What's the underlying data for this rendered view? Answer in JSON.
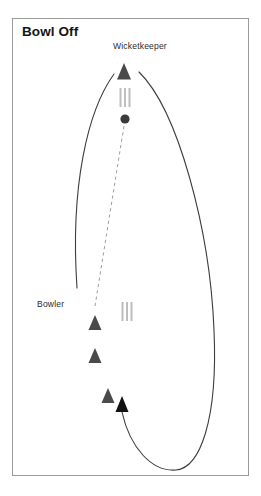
{
  "figure": {
    "title": "Bowl Off",
    "type": "cricket-field-diagram",
    "frame": {
      "x": 12,
      "y": 18,
      "width": 237,
      "height": 458,
      "border_color": "#9a9a9a"
    },
    "colors": {
      "ink": "#141414",
      "marker": "#4a4a4a",
      "stump": "#b5b5b5",
      "ball": "#3a3a3a",
      "path": "#3d3d3d",
      "dashed": "#9d9d9d",
      "frame": "#9a9a9a"
    }
  },
  "labels": [
    {
      "id": "wicketkeeper",
      "text": "Wicketkeeper",
      "x": 113,
      "y": 41
    },
    {
      "id": "bowler",
      "text": "Bowler",
      "x": 37,
      "y": 299
    }
  ],
  "markers": [
    {
      "id": "wicketkeeper-marker",
      "icon": "triangle-marker",
      "x": 124,
      "y": 72,
      "size": 13
    },
    {
      "id": "bowler-marker-1",
      "icon": "triangle-marker",
      "x": 95,
      "y": 323,
      "size": 12
    },
    {
      "id": "bowler-marker-2",
      "icon": "triangle-marker",
      "x": 95,
      "y": 356,
      "size": 12
    },
    {
      "id": "bowler-marker-3",
      "icon": "triangle-marker",
      "x": 108,
      "y": 396,
      "size": 12
    }
  ],
  "wickets": [
    {
      "id": "wicket-keeper-end",
      "icon": "stumps-icon",
      "x": 125,
      "y": 89,
      "width": 12,
      "height": 19
    },
    {
      "id": "wicket-bowler-end",
      "icon": "stumps-icon",
      "x": 127,
      "y": 303,
      "width": 12,
      "height": 19
    }
  ],
  "ball": {
    "id": "cricket-ball",
    "icon": "ball-icon",
    "cx": 125,
    "cy": 119,
    "r": 4.6
  },
  "paths": [
    {
      "id": "delivery-dashed-path",
      "style": "dashed",
      "description": "ball travel line from ball to bowler mark",
      "d": "M 124 126 L 95 306"
    },
    {
      "id": "left-run-up-arc",
      "style": "solid",
      "description": "left curved run-up arc",
      "d": "M 114 74 C 88 110, 70 185, 77 288"
    },
    {
      "id": "right-approach-arc",
      "style": "solid",
      "description": "long right hand curved approach, ends with arrowhead pointing up",
      "d": "M 139 72 C 178 110, 210 230, 214 330 C 218 420, 200 468, 176 470 C 152 472, 130 448, 122 412"
    }
  ],
  "arrowheads": [
    {
      "id": "approach-arrowhead",
      "icon": "arrow-up-icon",
      "x": 122,
      "y": 404,
      "direction": "up"
    }
  ]
}
